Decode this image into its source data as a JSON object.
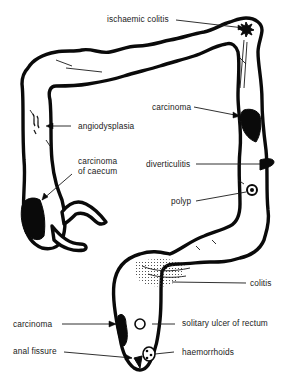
{
  "diagram": {
    "colors": {
      "outline": "#0a0a0a",
      "background": "#ffffff",
      "text": "#222222"
    },
    "labels": {
      "ischaemic_colitis": "ischaemic colitis",
      "carcinoma_descending": "carcinoma",
      "angiodysplasia": "angiodysplasia",
      "carcinoma_caecum_line1": "carcinoma",
      "carcinoma_caecum_line2": "of caecum",
      "diverticulitis": "diverticulitis",
      "polyp": "polyp",
      "colitis": "colitis",
      "carcinoma_rectum": "carcinoma",
      "solitary_ulcer": "solitary ulcer of rectum",
      "anal_fissure": "anal fissure",
      "haemorrhoids": "haemorrhoids"
    }
  }
}
